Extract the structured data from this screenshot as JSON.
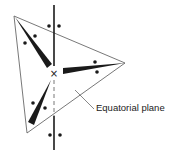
{
  "diagram": {
    "type": "trigonal bipyramidal molecular geometry",
    "label": "Equatorial plane",
    "colors": {
      "stroke": "#1a1a1a",
      "thin_line": "#555555",
      "text": "#222222",
      "background": "#ffffff"
    },
    "center_atom": {
      "symbol": "×",
      "x": 54,
      "y": 73
    },
    "axis": {
      "x": 54,
      "top_y": 5,
      "bottom_y": 150,
      "dashed_from": 79,
      "dashed_to": 116
    },
    "equatorial_triangle": {
      "vertices": [
        [
          14,
          16
        ],
        [
          125,
          63
        ],
        [
          27,
          133
        ]
      ]
    },
    "equatorial_bonds": [
      {
        "name": "upper-left",
        "from": [
          15,
          17
        ],
        "to": [
          50,
          67
        ]
      },
      {
        "name": "right",
        "from": [
          63,
          71
        ],
        "to": [
          125,
          63
        ]
      },
      {
        "name": "lower-left",
        "from": [
          51,
          80
        ],
        "to": [
          31,
          124
        ]
      }
    ],
    "lone_pair_dots": [
      {
        "group": "axial-top",
        "points": [
          [
            49,
            26
          ],
          [
            59,
            26
          ]
        ]
      },
      {
        "group": "axial-bottom",
        "points": [
          [
            50,
            135
          ],
          [
            60,
            135
          ]
        ]
      },
      {
        "group": "upper-left",
        "points": [
          [
            25,
            43
          ],
          [
            35,
            36
          ]
        ]
      },
      {
        "group": "right",
        "points": [
          [
            95,
            62
          ],
          [
            97,
            72
          ]
        ]
      },
      {
        "group": "lower-left",
        "points": [
          [
            33,
            103
          ],
          [
            45,
            108
          ]
        ]
      }
    ],
    "leader_line": {
      "from": [
        75,
        90
      ],
      "to": [
        94,
        109
      ]
    },
    "label_position": {
      "x": 96,
      "y": 111
    }
  }
}
